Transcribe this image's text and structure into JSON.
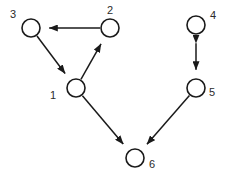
{
  "figure": {
    "width": 229,
    "height": 179,
    "background_color": "#ffffff",
    "stroke_color": "#1a1a1a",
    "label_color": "#2b2b2b",
    "node_fill_color": "#ffffff",
    "node_radius": 9
  },
  "chart_data": {
    "type": "diagram",
    "diagram_kind": "directed-graph",
    "node_count": 6,
    "edge_count": 6,
    "nodes": [
      {
        "id": "1",
        "label": "1",
        "cx": 76,
        "cy": 88,
        "r": 9,
        "label_x": 53,
        "label_y": 96,
        "label_anchor": "middle"
      },
      {
        "id": "2",
        "label": "2",
        "cx": 110,
        "cy": 28,
        "r": 9,
        "label_x": 110,
        "label_y": 11,
        "label_anchor": "middle"
      },
      {
        "id": "3",
        "label": "3",
        "cx": 31,
        "cy": 28,
        "r": 9,
        "label_x": 13,
        "label_y": 15,
        "label_anchor": "middle"
      },
      {
        "id": "4",
        "label": "4",
        "cx": 196,
        "cy": 25,
        "r": 9,
        "label_x": 213,
        "label_y": 16,
        "label_anchor": "middle"
      },
      {
        "id": "5",
        "label": "5",
        "cx": 196,
        "cy": 88,
        "r": 9,
        "label_x": 212,
        "label_y": 93,
        "label_anchor": "middle"
      },
      {
        "id": "6",
        "label": "6",
        "cx": 135,
        "cy": 158,
        "r": 9,
        "label_x": 152,
        "label_y": 165,
        "label_anchor": "middle"
      }
    ],
    "edges": [
      {
        "id": "edge-2-3",
        "from": "2",
        "to": "3",
        "directed": true,
        "bidirectional": false,
        "x1": 110,
        "y1": 28,
        "x2": 31,
        "y2": 28
      },
      {
        "id": "edge-3-1",
        "from": "3",
        "to": "1",
        "directed": true,
        "bidirectional": false,
        "x1": 31,
        "y1": 28,
        "x2": 76,
        "y2": 88
      },
      {
        "id": "edge-1-2",
        "from": "1",
        "to": "2",
        "directed": true,
        "bidirectional": false,
        "x1": 76,
        "y1": 88,
        "x2": 110,
        "y2": 28
      },
      {
        "id": "edge-1-6",
        "from": "1",
        "to": "6",
        "directed": true,
        "bidirectional": false,
        "x1": 76,
        "y1": 88,
        "x2": 135,
        "y2": 158
      },
      {
        "id": "edge-4-5",
        "from": "4",
        "to": "5",
        "directed": true,
        "bidirectional": true,
        "x1": 196,
        "y1": 25,
        "x2": 196,
        "y2": 88
      },
      {
        "id": "edge-5-6",
        "from": "5",
        "to": "6",
        "directed": true,
        "bidirectional": false,
        "x1": 196,
        "y1": 88,
        "x2": 135,
        "y2": 158
      }
    ],
    "adjacency_text": [
      "2 -> 3",
      "3 -> 1",
      "1 -> 2",
      "1 -> 6",
      "4 <-> 5",
      "5 -> 6"
    ]
  }
}
